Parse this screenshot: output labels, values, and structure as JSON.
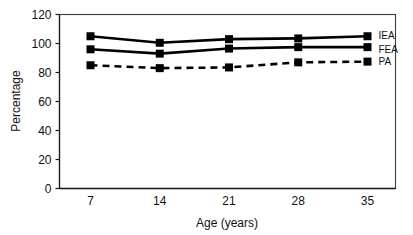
{
  "chart_data": {
    "type": "line",
    "title": "",
    "xlabel": "Age (years)",
    "ylabel": "Percentage",
    "categories": [
      7,
      14,
      21,
      28,
      35
    ],
    "x_tick_labels": [
      "7",
      "14",
      "21",
      "28",
      "35"
    ],
    "y_tick_labels": [
      "0",
      "20",
      "40",
      "60",
      "80",
      "100",
      "120"
    ],
    "y_ticks": [
      0,
      20,
      40,
      60,
      80,
      100,
      120
    ],
    "ylim": [
      0,
      120
    ],
    "grid": false,
    "legend_position": "right-inside",
    "series": [
      {
        "name": "IEA",
        "values": [
          105,
          100.5,
          103,
          103.5,
          105
        ],
        "line_style": "solid",
        "marker": "square",
        "color": "#000000"
      },
      {
        "name": "FEA",
        "values": [
          96,
          93,
          96.5,
          97.5,
          97.5
        ],
        "line_style": "solid",
        "marker": "square",
        "color": "#000000"
      },
      {
        "name": "PA",
        "values": [
          85,
          83,
          83.5,
          87,
          87.5
        ],
        "line_style": "dashed",
        "marker": "square",
        "color": "#000000"
      }
    ]
  },
  "axes": {
    "y_axis_title": "Percentage",
    "x_axis_title": "Age (years)"
  },
  "legend": {
    "items": [
      {
        "label": "IEA"
      },
      {
        "label": "FEA"
      },
      {
        "label": "PA"
      }
    ]
  }
}
